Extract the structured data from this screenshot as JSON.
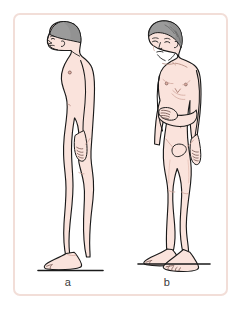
{
  "illustration": {
    "title": "Postural changes of ageing",
    "description": "Two line-drawing views of an unclothed older male figure illustrating a stooped, forward-flexed posture: a lateral (side) view and an anterior (front) view.",
    "background_color": "#ffffff",
    "border_color": "#f2ded8",
    "skin_fill": "#fae3dc",
    "skin_shadow": "#f0cfc6",
    "hair_fill": "#9b9b9b",
    "hair_shadow": "#7e7e7e",
    "outline_color": "#1a1a1a",
    "ground_line_color": "#1a1a1a"
  },
  "panels": [
    {
      "id": "a",
      "caption": "a",
      "view": "lateral",
      "view_label": "Side view",
      "posture": "stooped forward, kyphotic thoracic spine, head protracted, arms hanging, knees slightly flexed",
      "hair_color": "gray",
      "ground_line": true
    },
    {
      "id": "b",
      "caption": "b",
      "view": "anterior",
      "view_label": "Front view",
      "posture": "standing, head tilted down and to one side, right hand resting on abdomen, left arm hanging at side",
      "hair_color": "gray",
      "ground_line": true
    }
  ],
  "captions": {
    "a": "a",
    "b": "b"
  }
}
